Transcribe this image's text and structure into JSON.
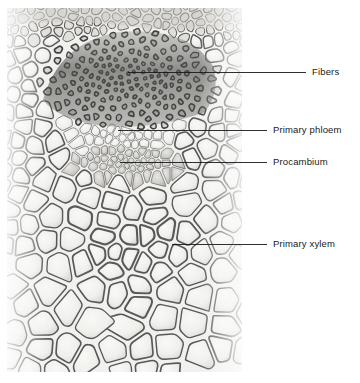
{
  "figure": {
    "type": "light-micrograph",
    "width": 360,
    "height": 383,
    "background_color": "#ffffff",
    "micrograph": {
      "x": 7,
      "y": 8,
      "width": 235,
      "height": 364,
      "base_tone": "#f2f2f0",
      "wall_color": "#545454",
      "lumen_color": "#f4f4f2",
      "fiber_cap_color": "#4a4a4a"
    }
  },
  "annotations": {
    "leader_color": "#1a1a1a",
    "leader_width": 0.9,
    "items": [
      {
        "id": "fibers",
        "label": "Fibers",
        "tip_x": 128,
        "tip_y": 72,
        "elbow_x": 242,
        "elbow_y": 72,
        "end_x": 306,
        "end_y": 72,
        "text_x": 312,
        "text_y": 67,
        "region": "sclerenchyma fiber cap"
      },
      {
        "id": "primary-phloem",
        "label": "Primary phloem",
        "tip_x": 118,
        "tip_y": 130,
        "elbow_x": 242,
        "elbow_y": 130,
        "end_x": 267,
        "end_y": 130,
        "text_x": 273,
        "text_y": 125,
        "region": "small thin-walled sieve tube region"
      },
      {
        "id": "procambium",
        "label": "Procambium",
        "tip_x": 120,
        "tip_y": 162,
        "elbow_x": 242,
        "elbow_y": 162,
        "end_x": 267,
        "end_y": 162,
        "text_x": 273,
        "text_y": 157,
        "region": "narrow band of dividing cells"
      },
      {
        "id": "primary-xylem",
        "label": "Primary xylem",
        "tip_x": 172,
        "tip_y": 244,
        "elbow_x": 242,
        "elbow_y": 244,
        "end_x": 267,
        "end_y": 244,
        "text_x": 273,
        "text_y": 239,
        "region": "large vessel elements"
      }
    ]
  }
}
